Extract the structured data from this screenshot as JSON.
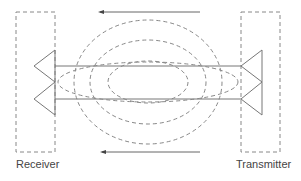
{
  "diagram": {
    "labels": {
      "receiver": "Receiver",
      "transmitter": "Transmitter"
    },
    "colors": {
      "line": "#777777",
      "dash": "#888888",
      "text": "#444444"
    }
  }
}
